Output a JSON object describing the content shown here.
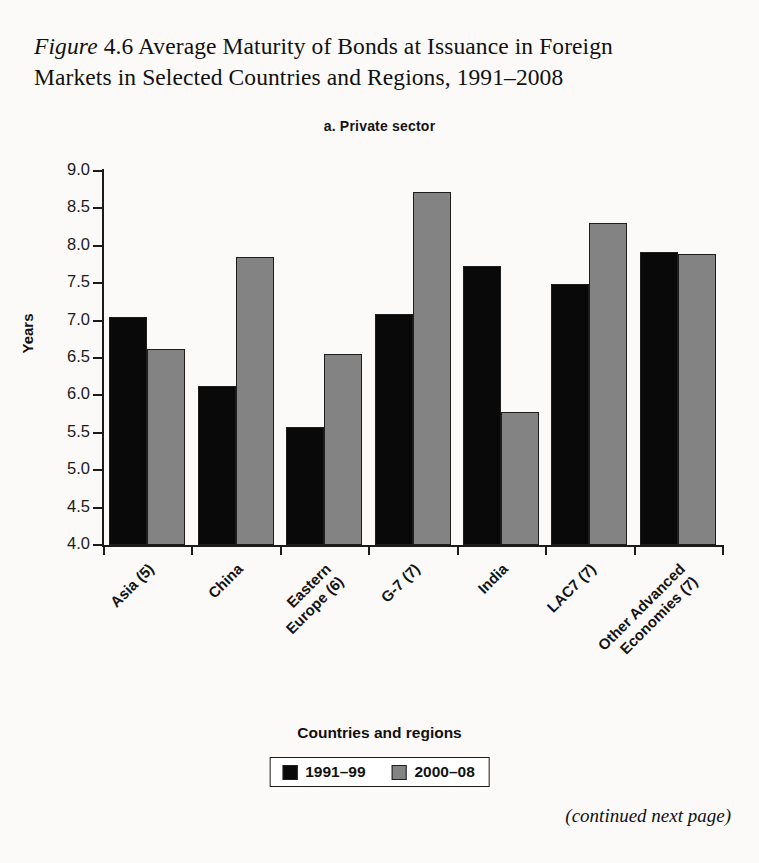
{
  "figure": {
    "label_italic": "Figure",
    "number": "4.6",
    "title": "Average Maturity of Bonds at Issuance in Foreign Markets in Selected Countries and Regions, 1991–2008",
    "caption_line1_rest": " Average Maturity of Bonds at Issuance in Foreign",
    "caption_line2": "Markets in Selected Countries and Regions, 1991–2008",
    "footer_note": "(continued next page)"
  },
  "colors": {
    "series_1991_99": "#090909",
    "series_2000_08": "#838383",
    "axis": "#1b1b1b",
    "page": "#fbfaf8"
  },
  "chart_data": {
    "type": "bar",
    "title": "a. Private sector",
    "xlabel": "Countries and regions",
    "ylabel": "Years",
    "ylim": [
      4.0,
      9.0
    ],
    "ytick_labels": [
      "9.0",
      "8.5",
      "8.0",
      "7.5",
      "7.0",
      "6.5",
      "6.0",
      "5.5",
      "5.0",
      "4.5",
      "4.0"
    ],
    "ytick_values": [
      9.0,
      8.5,
      8.0,
      7.5,
      7.0,
      6.5,
      6.0,
      5.5,
      5.0,
      4.5,
      4.0
    ],
    "grid": false,
    "legend_position": "bottom",
    "categories": [
      "Asia (5)",
      "China",
      "Eastern\nEurope (6)",
      "G-7 (7)",
      "India",
      "LAC7 (7)",
      "Other Advanced\nEconomies (7)"
    ],
    "series": [
      {
        "name": "1991–99",
        "color": "#090909",
        "values": [
          7.05,
          6.12,
          5.58,
          7.09,
          7.73,
          7.49,
          7.92
        ]
      },
      {
        "name": "2000–08",
        "color": "#838383",
        "values": [
          6.62,
          7.85,
          6.56,
          8.72,
          5.78,
          8.31,
          7.89
        ]
      }
    ]
  }
}
